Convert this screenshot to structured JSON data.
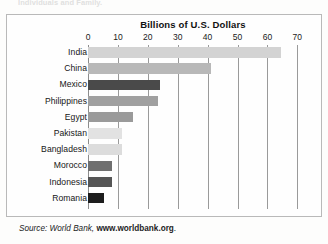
{
  "page": {
    "top_fragment_text": "Individuals and Family.",
    "source_prefix": "Source: World Bank,",
    "source_url": "www.worldbank.org",
    "source_suffix": "."
  },
  "chart_data": {
    "type": "bar",
    "orientation": "horizontal",
    "title": "Billions of U.S. Dollars",
    "xlabel": "",
    "ylabel": "",
    "xlim": [
      0,
      70
    ],
    "grid": true,
    "legend": "none",
    "tick_labels": [
      "0",
      "10",
      "20",
      "30",
      "40",
      "50",
      "60",
      "70"
    ],
    "ticks": [
      0,
      10,
      20,
      30,
      40,
      50,
      60,
      70
    ],
    "categories": [
      "India",
      "China",
      "Mexico",
      "Philippines",
      "Egypt",
      "Pakistan",
      "Bangladesh",
      "Morocco",
      "Indonesia",
      "Romania"
    ],
    "values": [
      64.5,
      41,
      24,
      23.5,
      15,
      11.5,
      11.5,
      8,
      8,
      5.5
    ],
    "bar_colors": [
      "#d3d3d3",
      "#b8b8b8",
      "#4a4a4a",
      "#a0a0a0",
      "#9a9a9a",
      "#e2e2e2",
      "#dcdcdc",
      "#6f6f6f",
      "#555555",
      "#1d1d1d"
    ],
    "bars": [
      {
        "label": "India",
        "value": 64.5,
        "color": "#d3d3d3"
      },
      {
        "label": "China",
        "value": 41,
        "color": "#b8b8b8"
      },
      {
        "label": "Mexico",
        "value": 24,
        "color": "#4a4a4a"
      },
      {
        "label": "Philippines",
        "value": 23.5,
        "color": "#a0a0a0"
      },
      {
        "label": "Egypt",
        "value": 15,
        "color": "#9a9a9a"
      },
      {
        "label": "Pakistan",
        "value": 11.5,
        "color": "#e2e2e2"
      },
      {
        "label": "Bangladesh",
        "value": 11.5,
        "color": "#dcdcdc"
      },
      {
        "label": "Morocco",
        "value": 8,
        "color": "#6f6f6f"
      },
      {
        "label": "Indonesia",
        "value": 8,
        "color": "#555555"
      },
      {
        "label": "Romania",
        "value": 5.5,
        "color": "#1d1d1d"
      }
    ]
  }
}
